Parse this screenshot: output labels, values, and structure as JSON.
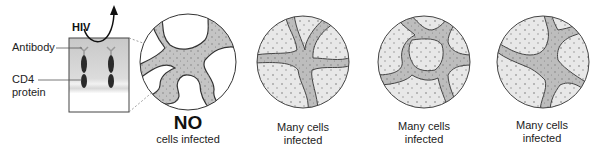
{
  "top_cutoff_text": "......",
  "left_panel": {
    "virus_label": "HIV",
    "antibody_label": "Antibody",
    "cd4_label_line1": "CD4",
    "cd4_label_line2": "protein"
  },
  "panels": [
    {
      "headline": "NO",
      "caption": "cells infected"
    },
    {
      "caption_line1": "Many cells",
      "caption_line2": "infected"
    },
    {
      "caption_line1": "Many cells",
      "caption_line2": "infected"
    },
    {
      "caption_line1": "Many cells",
      "caption_line2": "infected"
    }
  ],
  "colors": {
    "stroke": "#3a3a3a",
    "channel_fill": "#bdbdbd",
    "cell_clear": "#ffffff",
    "cell_infected": "#e6e6e6",
    "box_gradient_top": "#cfcfcf",
    "box_gradient_bottom": "#ffffff"
  }
}
